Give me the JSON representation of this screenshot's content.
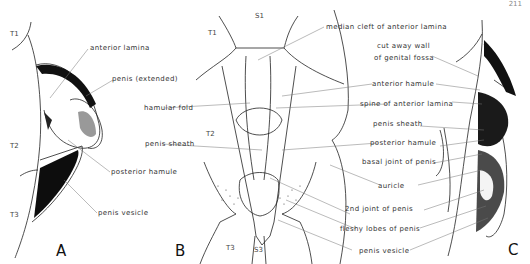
{
  "page_number": "211",
  "panels": {
    "A": {
      "letter": "A",
      "segments": [
        "T1",
        "T2",
        "T3"
      ],
      "labels": [
        "anterior lamina",
        "penis (extended)",
        "posterior hamule",
        "penis vesicle"
      ]
    },
    "B": {
      "letter": "B",
      "segments": [
        "S1",
        "T1",
        "T2",
        "T3",
        "S3"
      ],
      "labels": [
        "hamular fold",
        "penis sheath"
      ]
    },
    "C": {
      "letter": "C",
      "labels": [
        "median cleft of anterior lamina",
        "cut away wall",
        "of genital fossa",
        "anterior hamule",
        "spine of anterior lamina",
        "penis sheath",
        "posterior hamule",
        "basal joint of penis",
        "auricle",
        "2nd joint of penis",
        "fleshy lobes of penis",
        "penis vesicle"
      ]
    }
  }
}
